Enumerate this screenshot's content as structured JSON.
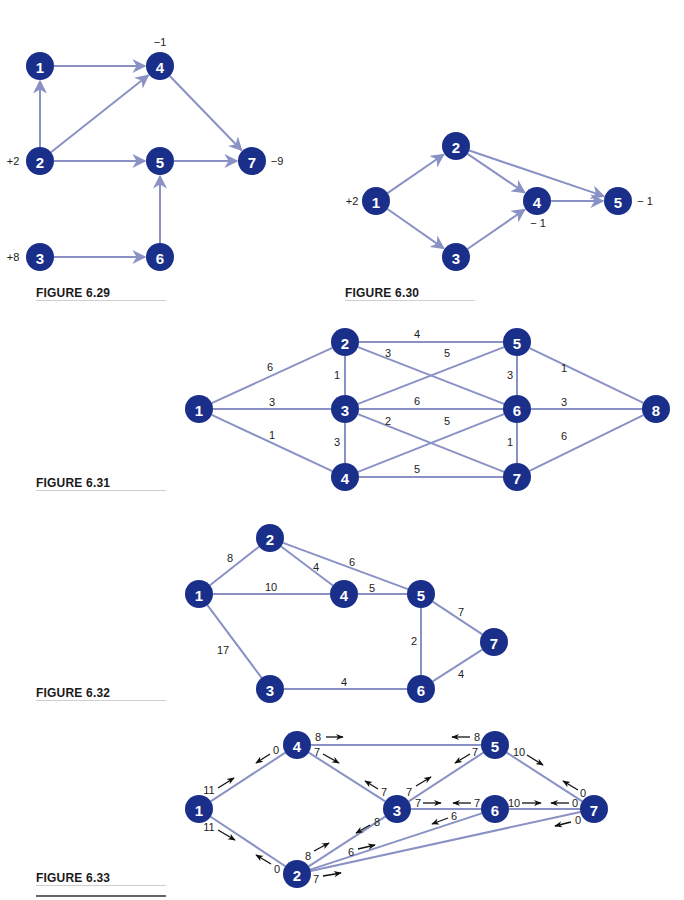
{
  "colors": {
    "node": "#1a2f8a",
    "edge": "#8a91c4",
    "text": "#222222"
  },
  "figures": [
    {
      "id": "fig629",
      "caption": "FIGURE 6.29",
      "caption_pos": [
        36,
        286
      ],
      "rule": [
        36,
        298,
        130
      ],
      "directed": true,
      "nodes": [
        {
          "id": "1",
          "x": 40,
          "y": 66
        },
        {
          "id": "4",
          "x": 160,
          "y": 66
        },
        {
          "id": "2",
          "x": 40,
          "y": 161
        },
        {
          "id": "5",
          "x": 160,
          "y": 161
        },
        {
          "id": "7",
          "x": 252,
          "y": 161
        },
        {
          "id": "3",
          "x": 40,
          "y": 257
        },
        {
          "id": "6",
          "x": 160,
          "y": 257
        }
      ],
      "edges": [
        {
          "from": "1",
          "to": "4"
        },
        {
          "from": "2",
          "to": "1"
        },
        {
          "from": "2",
          "to": "4"
        },
        {
          "from": "2",
          "to": "5"
        },
        {
          "from": "4",
          "to": "7"
        },
        {
          "from": "5",
          "to": "7"
        },
        {
          "from": "6",
          "to": "5"
        },
        {
          "from": "3",
          "to": "6"
        }
      ],
      "supplies": [
        {
          "node": "4",
          "text": "−1",
          "x": 160,
          "y": 42
        },
        {
          "node": "2",
          "text": "+2",
          "x": 13,
          "y": 161
        },
        {
          "node": "7",
          "text": "−9",
          "x": 277,
          "y": 161
        },
        {
          "node": "3",
          "text": "+8",
          "x": 13,
          "y": 257
        }
      ]
    },
    {
      "id": "fig630",
      "caption": "FIGURE 6.30",
      "caption_pos": [
        345,
        286
      ],
      "rule": [
        345,
        298,
        130
      ],
      "directed": true,
      "nodes": [
        {
          "id": "1",
          "x": 376,
          "y": 201
        },
        {
          "id": "2",
          "x": 456,
          "y": 146
        },
        {
          "id": "3",
          "x": 456,
          "y": 257
        },
        {
          "id": "4",
          "x": 537,
          "y": 201
        },
        {
          "id": "5",
          "x": 618,
          "y": 201
        }
      ],
      "edges": [
        {
          "from": "1",
          "to": "2"
        },
        {
          "from": "1",
          "to": "3"
        },
        {
          "from": "2",
          "to": "4"
        },
        {
          "from": "2",
          "to": "5"
        },
        {
          "from": "3",
          "to": "4"
        },
        {
          "from": "4",
          "to": "5"
        }
      ],
      "supplies": [
        {
          "node": "1",
          "text": "+2",
          "x": 352,
          "y": 201
        },
        {
          "node": "4",
          "text": "− 1",
          "x": 538,
          "y": 223
        },
        {
          "node": "5",
          "text": "− 1",
          "x": 645,
          "y": 201
        }
      ]
    },
    {
      "id": "fig631",
      "caption": "FIGURE 6.31",
      "caption_pos": [
        36,
        476
      ],
      "rule": [
        36,
        490,
        130
      ],
      "directed": false,
      "nodes": [
        {
          "id": "1",
          "x": 199,
          "y": 409
        },
        {
          "id": "2",
          "x": 345,
          "y": 342
        },
        {
          "id": "3",
          "x": 345,
          "y": 409
        },
        {
          "id": "4",
          "x": 345,
          "y": 477
        },
        {
          "id": "5",
          "x": 517,
          "y": 342
        },
        {
          "id": "6",
          "x": 517,
          "y": 409
        },
        {
          "id": "7",
          "x": 517,
          "y": 477
        },
        {
          "id": "8",
          "x": 656,
          "y": 409
        }
      ],
      "edges": [
        {
          "from": "1",
          "to": "2",
          "w": "6",
          "lx": 270,
          "ly": 367
        },
        {
          "from": "1",
          "to": "3",
          "w": "3",
          "lx": 272,
          "ly": 402
        },
        {
          "from": "1",
          "to": "4",
          "w": "1",
          "lx": 272,
          "ly": 435
        },
        {
          "from": "2",
          "to": "3",
          "w": "1",
          "lx": 337,
          "ly": 375
        },
        {
          "from": "3",
          "to": "4",
          "w": "3",
          "lx": 337,
          "ly": 442
        },
        {
          "from": "2",
          "to": "5",
          "w": "4",
          "lx": 417,
          "ly": 334
        },
        {
          "from": "2",
          "to": "6",
          "w": "3",
          "lx": 388,
          "ly": 353
        },
        {
          "from": "3",
          "to": "5",
          "w": "5",
          "lx": 447,
          "ly": 353
        },
        {
          "from": "3",
          "to": "6",
          "w": "6",
          "lx": 417,
          "ly": 401
        },
        {
          "from": "3",
          "to": "7",
          "w": "2",
          "lx": 388,
          "ly": 421
        },
        {
          "from": "4",
          "to": "6",
          "w": "5",
          "lx": 447,
          "ly": 421
        },
        {
          "from": "4",
          "to": "7",
          "w": "5",
          "lx": 417,
          "ly": 469
        },
        {
          "from": "5",
          "to": "6",
          "w": "3",
          "lx": 510,
          "ly": 375
        },
        {
          "from": "6",
          "to": "7",
          "w": "1",
          "lx": 510,
          "ly": 442
        },
        {
          "from": "5",
          "to": "8",
          "w": "1",
          "lx": 564,
          "ly": 368
        },
        {
          "from": "6",
          "to": "8",
          "w": "3",
          "lx": 564,
          "ly": 402
        },
        {
          "from": "7",
          "to": "8",
          "w": "6",
          "lx": 564,
          "ly": 436
        }
      ],
      "supplies": []
    },
    {
      "id": "fig632",
      "caption": "FIGURE 6.32",
      "caption_pos": [
        36,
        686
      ],
      "rule": [
        36,
        699,
        130
      ],
      "directed": false,
      "nodes": [
        {
          "id": "1",
          "x": 199,
          "y": 594
        },
        {
          "id": "2",
          "x": 270,
          "y": 538
        },
        {
          "id": "4",
          "x": 344,
          "y": 594
        },
        {
          "id": "5",
          "x": 421,
          "y": 594
        },
        {
          "id": "7",
          "x": 494,
          "y": 642
        },
        {
          "id": "3",
          "x": 270,
          "y": 689
        },
        {
          "id": "6",
          "x": 421,
          "y": 689
        }
      ],
      "edges": [
        {
          "from": "1",
          "to": "2",
          "w": "8",
          "lx": 230,
          "ly": 558
        },
        {
          "from": "1",
          "to": "4",
          "w": "10",
          "lx": 271,
          "ly": 587
        },
        {
          "from": "1",
          "to": "3",
          "w": "17",
          "lx": 223,
          "ly": 650
        },
        {
          "from": "2",
          "to": "4",
          "w": "4",
          "lx": 316,
          "ly": 567
        },
        {
          "from": "2",
          "to": "5",
          "w": "6",
          "lx": 352,
          "ly": 562
        },
        {
          "from": "4",
          "to": "5",
          "w": "5",
          "lx": 372,
          "ly": 588
        },
        {
          "from": "5",
          "to": "7",
          "w": "7",
          "lx": 461,
          "ly": 612
        },
        {
          "from": "5",
          "to": "6",
          "w": "2",
          "lx": 414,
          "ly": 641
        },
        {
          "from": "3",
          "to": "6",
          "w": "4",
          "lx": 344,
          "ly": 682
        },
        {
          "from": "6",
          "to": "7",
          "w": "4",
          "lx": 461,
          "ly": 674
        }
      ],
      "supplies": []
    },
    {
      "id": "fig633",
      "caption": "FIGURE 6.33",
      "caption_pos": [
        36,
        871
      ],
      "rule": [
        36,
        884,
        130
      ],
      "rule2": [
        36,
        895,
        130
      ],
      "directed": false,
      "nodes": [
        {
          "id": "4",
          "x": 297,
          "y": 745
        },
        {
          "id": "5",
          "x": 495,
          "y": 745
        },
        {
          "id": "1",
          "x": 199,
          "y": 809
        },
        {
          "id": "3",
          "x": 397,
          "y": 809
        },
        {
          "id": "6",
          "x": 495,
          "y": 809
        },
        {
          "id": "7",
          "x": 594,
          "y": 809
        },
        {
          "id": "2",
          "x": 297,
          "y": 874
        }
      ],
      "edges": [
        {
          "from": "1",
          "to": "4"
        },
        {
          "from": "1",
          "to": "2"
        },
        {
          "from": "4",
          "to": "5"
        },
        {
          "from": "4",
          "to": "3"
        },
        {
          "from": "3",
          "to": "5"
        },
        {
          "from": "3",
          "to": "6"
        },
        {
          "from": "3",
          "to": "2"
        },
        {
          "from": "2",
          "to": "6"
        },
        {
          "from": "2",
          "to": "7"
        },
        {
          "from": "5",
          "to": "7"
        },
        {
          "from": "6",
          "to": "7"
        }
      ],
      "flows": [
        {
          "text": "0",
          "tx": 276,
          "ty": 750,
          "ax1": 270,
          "ay1": 754,
          "ax2": 256,
          "ay2": 763
        },
        {
          "text": "8",
          "tx": 318,
          "ty": 737,
          "ax1": 326,
          "ay1": 737,
          "ax2": 343,
          "ay2": 737
        },
        {
          "text": "7",
          "tx": 317,
          "ty": 752,
          "ax1": 323,
          "ay1": 754,
          "ax2": 339,
          "ay2": 763
        },
        {
          "text": "11",
          "tx": 209,
          "ty": 790,
          "ax1": 218,
          "ay1": 788,
          "ax2": 234,
          "ay2": 778
        },
        {
          "text": "11",
          "tx": 209,
          "ty": 827,
          "ax1": 218,
          "ay1": 830,
          "ax2": 235,
          "ay2": 840
        },
        {
          "text": "7",
          "tx": 384,
          "ty": 792,
          "ax1": 378,
          "ay1": 789,
          "ax2": 365,
          "ay2": 781
        },
        {
          "text": "8",
          "tx": 377,
          "ty": 822,
          "ax1": 370,
          "ay1": 825,
          "ax2": 356,
          "ay2": 833
        },
        {
          "text": "7",
          "tx": 409,
          "ty": 792,
          "ax1": 416,
          "ay1": 786,
          "ax2": 431,
          "ay2": 777
        },
        {
          "text": "7",
          "tx": 418,
          "ty": 803,
          "ax1": 423,
          "ay1": 803,
          "ax2": 441,
          "ay2": 803
        },
        {
          "text": "7",
          "tx": 477,
          "ty": 803,
          "ax1": 471,
          "ay1": 803,
          "ax2": 453,
          "ay2": 803
        },
        {
          "text": "6",
          "tx": 454,
          "ty": 816,
          "ax1": 448,
          "ay1": 818,
          "ax2": 432,
          "ay2": 824
        },
        {
          "text": "8",
          "tx": 477,
          "ty": 737,
          "ax1": 470,
          "ay1": 737,
          "ax2": 452,
          "ay2": 737
        },
        {
          "text": "7",
          "tx": 475,
          "ty": 752,
          "ax1": 470,
          "ay1": 754,
          "ax2": 455,
          "ay2": 763
        },
        {
          "text": "10",
          "tx": 519,
          "ty": 752,
          "ax1": 527,
          "ay1": 755,
          "ax2": 543,
          "ay2": 765
        },
        {
          "text": "0",
          "tx": 583,
          "ty": 793,
          "ax1": 578,
          "ay1": 790,
          "ax2": 563,
          "ay2": 781
        },
        {
          "text": "10",
          "tx": 514,
          "ty": 803,
          "ax1": 522,
          "ay1": 803,
          "ax2": 541,
          "ay2": 803
        },
        {
          "text": "0",
          "tx": 575,
          "ty": 803,
          "ax1": 569,
          "ay1": 803,
          "ax2": 551,
          "ay2": 803
        },
        {
          "text": "0",
          "tx": 578,
          "ty": 820,
          "ax1": 571,
          "ay1": 822,
          "ax2": 555,
          "ay2": 826
        },
        {
          "text": "8",
          "tx": 308,
          "ty": 856,
          "ax1": 314,
          "ay1": 851,
          "ax2": 329,
          "ay2": 843
        },
        {
          "text": "6",
          "tx": 351,
          "ty": 852,
          "ax1": 358,
          "ay1": 849,
          "ax2": 375,
          "ay2": 845
        },
        {
          "text": "0",
          "tx": 277,
          "ty": 869,
          "ax1": 271,
          "ay1": 864,
          "ax2": 256,
          "ay2": 855
        },
        {
          "text": "7",
          "tx": 316,
          "ty": 879,
          "ax1": 323,
          "ay1": 876,
          "ax2": 341,
          "ay2": 873
        }
      ],
      "supplies": []
    }
  ]
}
